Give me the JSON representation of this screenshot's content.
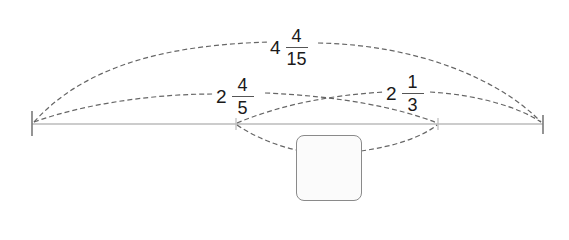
{
  "diagram": {
    "colors": {
      "line": "#999999",
      "dash": "#666666",
      "text": "#1a1a1a",
      "box_border": "#8a8a8a",
      "box_fill": "#fbfbfb"
    },
    "labels": {
      "total": {
        "whole": "4",
        "numerator": "4",
        "denominator": "15"
      },
      "left_segment": {
        "whole": "2",
        "numerator": "4",
        "denominator": "5"
      },
      "right_segment": {
        "whole": "2",
        "numerator": "1",
        "denominator": "3"
      }
    },
    "unknown_box": {
      "value": ""
    }
  }
}
